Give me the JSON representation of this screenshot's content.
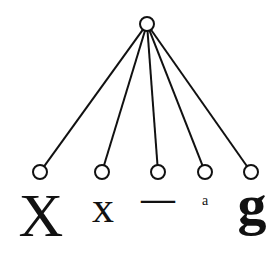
{
  "diagram": {
    "type": "tree",
    "root": {
      "id": "root",
      "x": 147,
      "y": 24,
      "r": 7
    },
    "leaves": [
      {
        "id": "leaf-1",
        "x": 40,
        "y": 172,
        "label": "X",
        "label_x": 41,
        "label_y": 236,
        "font_size": 62,
        "weight": "normal"
      },
      {
        "id": "leaf-2",
        "x": 102,
        "y": 172,
        "label": "x",
        "label_x": 103,
        "label_y": 222,
        "font_size": 44,
        "weight": "normal"
      },
      {
        "id": "leaf-3",
        "x": 158,
        "y": 172,
        "label": "—",
        "label_x": 158,
        "label_y": 210,
        "font_size": 34,
        "weight": "bold"
      },
      {
        "id": "leaf-4",
        "x": 205,
        "y": 172,
        "label": "a",
        "label_x": 205,
        "label_y": 205,
        "font_size": 14,
        "weight": "normal"
      },
      {
        "id": "leaf-5",
        "x": 251,
        "y": 172,
        "label": "g",
        "label_x": 252,
        "label_y": 224,
        "font_size": 58,
        "weight": "bold"
      }
    ],
    "node_radius": 7,
    "stroke_color": "#111111",
    "fill_color": "#ffffff"
  }
}
